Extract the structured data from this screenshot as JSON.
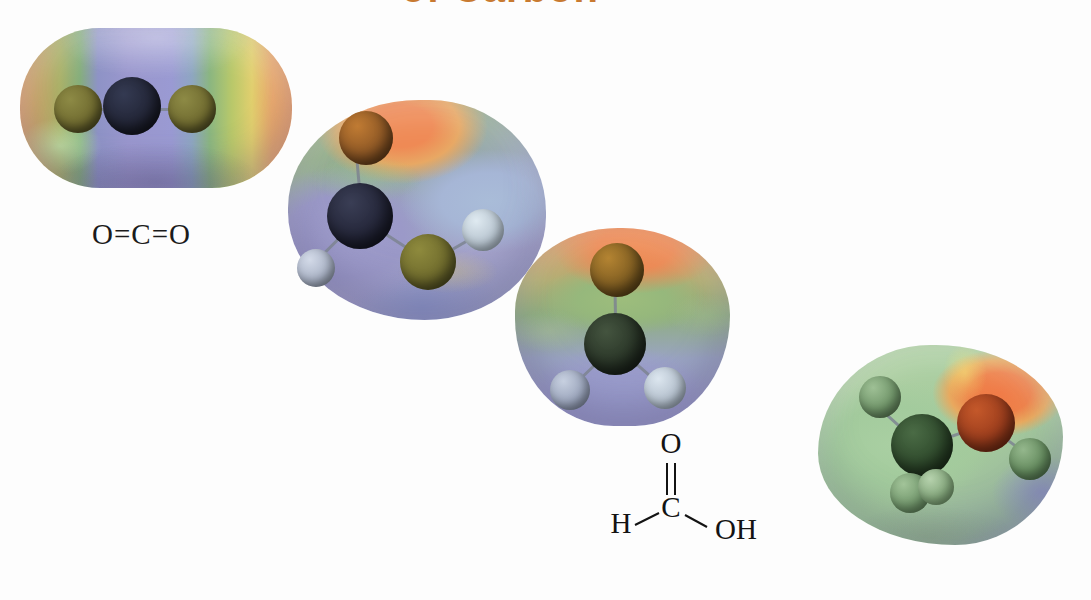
{
  "figure": {
    "title_remnant": "of Carbon",
    "background_color": "#ffffff",
    "caption_note": "Electrostatic potential maps of four carbon compounds",
    "width": 1091,
    "height": 600
  },
  "color_scale": {
    "most_negative": "#8e93c4",
    "negative": "#9a9ad0",
    "neutral_green": "#9abd82",
    "neutral_yellow": "#e0cf72",
    "positive_orange": "#ef8a55",
    "most_positive": "#f07a46"
  },
  "molecules": [
    {
      "id": "carbon-dioxide",
      "name": "Carbon dioxide",
      "label": "O=C=O",
      "label_parts": {
        "left_atom": "O",
        "bond1": "=",
        "center_atom": "C",
        "bond2": "=",
        "right_atom": "O"
      },
      "surface_shape": "rounded-rectangle",
      "atoms": [
        {
          "element": "O",
          "color": "#6f6a2f",
          "x": 58,
          "y": 58,
          "r": 24
        },
        {
          "element": "C",
          "color": "#222536",
          "x": 112,
          "y": 54,
          "r": 29
        },
        {
          "element": "O",
          "color": "#6f6a2f",
          "x": 172,
          "y": 58,
          "r": 24
        }
      ]
    },
    {
      "id": "formic-acid",
      "name": "Formic acid",
      "label": "HCOOH",
      "structure": {
        "top_atom": "O",
        "center_atom": "C",
        "left_atom": "H",
        "right_group": "OH",
        "top_bond": "double",
        "left_bond": "single",
        "right_bond": "single"
      },
      "atoms": [
        {
          "element": "O",
          "color": "#8a5524",
          "x": 78,
          "y": 38,
          "r": 27
        },
        {
          "element": "C",
          "color": "#242639",
          "x": 72,
          "y": 116,
          "r": 33
        },
        {
          "element": "H",
          "color": "#aab3c6",
          "x": 28,
          "y": 168,
          "r": 19
        },
        {
          "element": "O",
          "color": "#6e6a2c",
          "x": 140,
          "y": 162,
          "r": 28
        },
        {
          "element": "H",
          "color": "#b7c4cf",
          "x": 195,
          "y": 130,
          "r": 21
        }
      ]
    },
    {
      "id": "formaldehyde",
      "name": "Formaldehyde",
      "label": "HCHO",
      "structure": {
        "top_atom": "O",
        "center_atom": "C",
        "left_atom": "H",
        "right_atom": "H",
        "top_bond": "double",
        "left_bond": "single",
        "right_bond": "single"
      },
      "atoms": [
        {
          "element": "O",
          "color": "#7b5a20",
          "x": 102,
          "y": 42,
          "r": 27
        },
        {
          "element": "C",
          "color": "#2a3628",
          "x": 100,
          "y": 116,
          "r": 31
        },
        {
          "element": "H",
          "color": "#9aa4bb",
          "x": 55,
          "y": 162,
          "r": 20
        },
        {
          "element": "H",
          "color": "#b3bfcc",
          "x": 150,
          "y": 160,
          "r": 21
        }
      ]
    },
    {
      "id": "methanol",
      "name": "Methanol",
      "label": "CH3OH",
      "label_html": "CH<sub>3</sub>OH",
      "atoms": [
        {
          "element": "H",
          "color": "#6f9468",
          "x": 62,
          "y": 52,
          "r": 21
        },
        {
          "element": "C",
          "color": "#2f4a2c",
          "x": 104,
          "y": 100,
          "r": 31
        },
        {
          "element": "O",
          "color": "#9a3c1c",
          "x": 168,
          "y": 78,
          "r": 29
        },
        {
          "element": "H",
          "color": "#638a5d",
          "x": 212,
          "y": 114,
          "r": 21
        },
        {
          "element": "H",
          "color": "#72976c",
          "x": 92,
          "y": 148,
          "r": 20
        },
        {
          "element": "H",
          "color": "#82a57a",
          "x": 118,
          "y": 142,
          "r": 18
        }
      ]
    }
  ]
}
